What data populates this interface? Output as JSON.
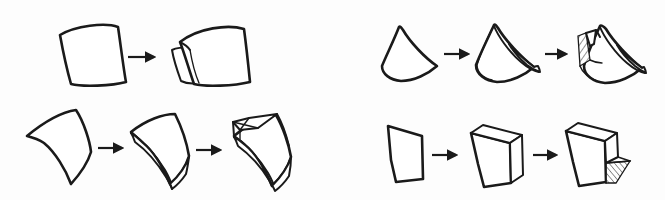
{
  "figure": {
    "title": "Surface shelling / thickening transformation sequences",
    "background_color": "#fdfdfd",
    "ink_color": "#1a1a1a",
    "width": 665,
    "height": 200,
    "panel_count": 4,
    "arrow_glyph": "→"
  },
  "panels": [
    {
      "id": "panel-top-left",
      "name": "trapezoid-split-sequence",
      "position": "top-left",
      "step_count": 2,
      "arrow_count": 1,
      "steps": [
        {
          "index": 1,
          "label": "",
          "shape": "curved-trapezoid-outline",
          "shaded": false,
          "hatched": false
        },
        {
          "index": 2,
          "label": "",
          "shape": "trapezoid-with-detached-left-flap",
          "shaded": false,
          "hatched": false
        }
      ]
    },
    {
      "id": "panel-bottom-left",
      "name": "curved-patch-thicken-sequence",
      "position": "bottom-left",
      "step_count": 3,
      "arrow_count": 2,
      "steps": [
        {
          "index": 1,
          "label": "",
          "shape": "concave-curved-patch-outline",
          "shaded": false,
          "hatched": false
        },
        {
          "index": 2,
          "label": "",
          "shape": "curved-patch-thickened-shell",
          "shaded": false,
          "hatched": false
        },
        {
          "index": 3,
          "label": "",
          "shape": "curved-shell-with-opened-top-flap",
          "shaded": false,
          "hatched": false
        }
      ]
    },
    {
      "id": "panel-top-right",
      "name": "fan-patch-thicken-sequence",
      "position": "top-right",
      "step_count": 3,
      "arrow_count": 2,
      "steps": [
        {
          "index": 1,
          "label": "",
          "shape": "fan-shaped-curved-patch-outline",
          "shaded": false,
          "hatched": false
        },
        {
          "index": 2,
          "label": "",
          "shape": "fan-patch-thickened-shell",
          "shaded": false,
          "hatched": false
        },
        {
          "index": 3,
          "label": "",
          "shape": "fan-shell-with-hatched-cut-face",
          "shaded": true,
          "hatched": true
        }
      ]
    },
    {
      "id": "panel-bottom-right",
      "name": "planar-quad-extrude-sequence",
      "position": "bottom-right",
      "step_count": 3,
      "arrow_count": 2,
      "steps": [
        {
          "index": 1,
          "label": "",
          "shape": "planar-quadrilateral-outline",
          "shaded": false,
          "hatched": false
        },
        {
          "index": 2,
          "label": "",
          "shape": "quadrilateral-extruded-slab",
          "shaded": false,
          "hatched": false
        },
        {
          "index": 3,
          "label": "",
          "shape": "slab-with-hatched-wedge-flap",
          "shaded": true,
          "hatched": true
        }
      ]
    }
  ],
  "annotations": {
    "caption": "",
    "legend": []
  }
}
